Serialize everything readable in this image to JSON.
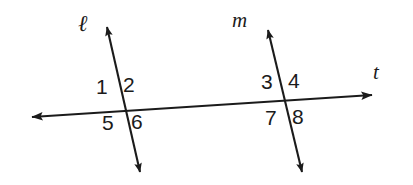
{
  "figure": {
    "background_color": "#ffffff",
    "ink_color": "#1b1b1b"
  },
  "lines": [
    {
      "id": "line-l",
      "label": "ℓ",
      "label_style": "script-italic",
      "label_x": 78,
      "label_y": 12,
      "x1": 107,
      "y1": 27,
      "x2": 140,
      "y2": 172,
      "arrow_start": true,
      "arrow_end": true,
      "stroke_width": 2.1
    },
    {
      "id": "line-m",
      "label": "m",
      "label_style": "italic",
      "label_x": 232,
      "label_y": 10,
      "x1": 268,
      "y1": 30,
      "x2": 302,
      "y2": 172,
      "arrow_start": true,
      "arrow_end": true,
      "stroke_width": 2.1
    },
    {
      "id": "line-t",
      "label": "t",
      "label_style": "italic",
      "label_x": 373,
      "label_y": 62,
      "x1": 32,
      "y1": 117,
      "x2": 372,
      "y2": 95,
      "arrow_start": true,
      "arrow_end": true,
      "stroke_width": 2.1
    }
  ],
  "intersections": [
    {
      "id": "intersection-l-t",
      "lines": [
        "line-l",
        "line-t"
      ],
      "x": 120,
      "y": 106
    },
    {
      "id": "intersection-m-t",
      "lines": [
        "line-m",
        "line-t"
      ],
      "x": 285,
      "y": 101
    }
  ],
  "angle_labels": [
    {
      "id": "angle-1",
      "text": "1",
      "x": 96,
      "y": 76,
      "position": "upper-left",
      "intersection": "intersection-l-t"
    },
    {
      "id": "angle-2",
      "text": "2",
      "x": 123,
      "y": 74,
      "position": "upper-right",
      "intersection": "intersection-l-t"
    },
    {
      "id": "angle-5",
      "text": "5",
      "x": 102,
      "y": 112,
      "position": "lower-left",
      "intersection": "intersection-l-t"
    },
    {
      "id": "angle-6",
      "text": "6",
      "x": 131,
      "y": 111,
      "position": "lower-right",
      "intersection": "intersection-l-t"
    },
    {
      "id": "angle-3",
      "text": "3",
      "x": 261,
      "y": 71,
      "position": "upper-left",
      "intersection": "intersection-m-t"
    },
    {
      "id": "angle-4",
      "text": "4",
      "x": 288,
      "y": 70,
      "position": "upper-right",
      "intersection": "intersection-m-t"
    },
    {
      "id": "angle-7",
      "text": "7",
      "x": 265,
      "y": 107,
      "position": "lower-left",
      "intersection": "intersection-m-t"
    },
    {
      "id": "angle-8",
      "text": "8",
      "x": 292,
      "y": 106,
      "position": "lower-right",
      "intersection": "intersection-m-t"
    }
  ]
}
